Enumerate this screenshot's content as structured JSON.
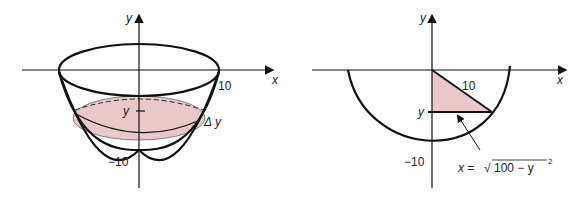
{
  "left_figure": {
    "axis_x_label": "x",
    "axis_y_label": "y",
    "label_10": "10",
    "label_neg10": "−10",
    "label_y": "y",
    "label_delta_y": "Δ y",
    "shade_color": "#e8c8c8",
    "stroke_color": "#111111"
  },
  "right_figure": {
    "axis_x_label": "x",
    "axis_y_label": "y",
    "label_10": "10",
    "label_neg10": "−10",
    "label_y": "y",
    "equation_lhs": "x =",
    "equation_sqrt": "√",
    "equation_radicand": "100 − y",
    "equation_exp": "2",
    "shade_color": "#e8c8c8",
    "stroke_color": "#111111"
  }
}
